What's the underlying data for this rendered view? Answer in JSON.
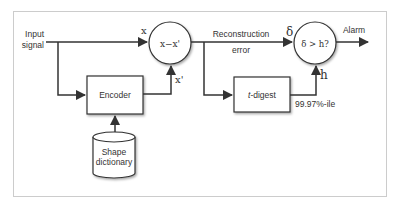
{
  "diagram": {
    "input_label_line1": "Input",
    "input_label_line2": "signal",
    "x_label": "x",
    "subtract_node": "x−x'",
    "x_prime_label": "x'",
    "encoder": "Encoder",
    "dictionary_line1": "Shape",
    "dictionary_line2": "dictionary",
    "recon_label_line1": "Reconstruction",
    "recon_label_line2": "error",
    "delta_label": "δ",
    "threshold_node": "δ > h?",
    "h_label": "h",
    "alarm_label": "Alarm",
    "tdigest_italic": "t",
    "tdigest_rest": "-digest",
    "percentile_label": "99.97%-ile"
  },
  "colors": {
    "line": "#333333",
    "border": "#cccccc",
    "text": "#333333"
  }
}
